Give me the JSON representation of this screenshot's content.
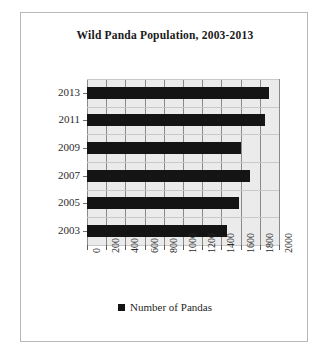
{
  "chart_data": {
    "type": "bar",
    "orientation": "horizontal",
    "title": "Wild Panda Population, 2003-2013",
    "xlabel": "",
    "ylabel": "",
    "categories": [
      "2013",
      "2011",
      "2009",
      "2007",
      "2005",
      "2003"
    ],
    "values": [
      1900,
      1850,
      1600,
      1700,
      1580,
      1460
    ],
    "series": [
      {
        "name": "Number of Pandas",
        "values": [
          1900,
          1850,
          1600,
          1700,
          1580,
          1460
        ],
        "color": "#141414"
      }
    ],
    "xlim": [
      0,
      2000
    ],
    "xticks": [
      "0",
      "200",
      "400",
      "600",
      "800",
      "1000",
      "1200",
      "1400",
      "1600",
      "1800",
      "2000"
    ],
    "xtick_values": [
      0,
      200,
      400,
      600,
      800,
      1000,
      1200,
      1400,
      1600,
      1800,
      2000
    ],
    "grid": true,
    "grid_axis": "both",
    "legend": {
      "position": "bottom",
      "entries": [
        {
          "label": "Number of Pandas",
          "marker": "square",
          "color": "#141414"
        }
      ]
    },
    "plot_background": "#ebebeb",
    "tick_label_rotation": -90
  }
}
